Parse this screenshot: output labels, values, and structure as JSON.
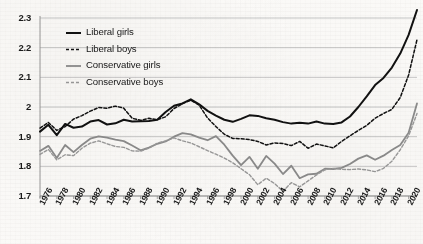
{
  "chart_data": {
    "type": "line",
    "title": "",
    "subtitle": "",
    "xlabel": "",
    "ylabel": "",
    "xlim": [
      1976,
      2021
    ],
    "ylim": [
      1.7,
      2.33
    ],
    "grid": true,
    "grid_axis": "y",
    "legend_position": "top-left",
    "y_ticks": [
      "1.7",
      "1.8",
      "1.9",
      "2",
      "2.1",
      "2.2",
      "2.3"
    ],
    "y_tick_values": [
      1.7,
      1.8,
      1.9,
      2.0,
      2.1,
      2.2,
      2.3
    ],
    "x_ticks": [
      "1976",
      "1978",
      "1980",
      "1982",
      "1984",
      "1986",
      "1988",
      "1990",
      "1992",
      "1994",
      "1996",
      "1998",
      "2000",
      "2002",
      "2004",
      "2006",
      "2008",
      "2010",
      "2012",
      "2014",
      "2016",
      "2018",
      "2020"
    ],
    "x_tick_values": [
      1976,
      1978,
      1980,
      1982,
      1984,
      1986,
      1988,
      1990,
      1992,
      1994,
      1996,
      1998,
      2000,
      2002,
      2004,
      2006,
      2008,
      2010,
      2012,
      2014,
      2016,
      2018,
      2020
    ],
    "x": [
      1976,
      1977,
      1978,
      1979,
      1980,
      1981,
      1982,
      1983,
      1984,
      1985,
      1986,
      1987,
      1988,
      1989,
      1990,
      1991,
      1992,
      1993,
      1994,
      1995,
      1996,
      1997,
      1998,
      1999,
      2000,
      2001,
      2002,
      2003,
      2004,
      2005,
      2006,
      2007,
      2008,
      2009,
      2010,
      2011,
      2012,
      2013,
      2014,
      2015,
      2016,
      2017,
      2018,
      2019,
      2020,
      2021
    ],
    "series": [
      {
        "name": "Liberal girls",
        "color": "#111111",
        "style": "solid",
        "width": 2.0,
        "values": [
          1.917,
          1.94,
          1.905,
          1.943,
          1.93,
          1.934,
          1.951,
          1.956,
          1.941,
          1.945,
          1.957,
          1.951,
          1.952,
          1.953,
          1.957,
          1.983,
          2.004,
          2.012,
          2.026,
          2.009,
          1.987,
          1.971,
          1.957,
          1.95,
          1.96,
          1.972,
          1.97,
          1.962,
          1.957,
          1.949,
          1.944,
          1.947,
          1.944,
          1.951,
          1.944,
          1.943,
          1.948,
          1.968,
          2.0,
          2.036,
          2.074,
          2.098,
          2.133,
          2.18,
          2.243,
          2.327
        ]
      },
      {
        "name": "Liberal boys",
        "color": "#111111",
        "style": "dashed",
        "width": 1.5,
        "values": [
          1.929,
          1.948,
          1.921,
          1.934,
          1.959,
          1.971,
          1.986,
          1.998,
          1.996,
          2.003,
          1.996,
          1.962,
          1.955,
          1.962,
          1.957,
          1.967,
          1.995,
          2.011,
          2.023,
          2.006,
          1.963,
          1.934,
          1.908,
          1.894,
          1.893,
          1.89,
          1.884,
          1.872,
          1.879,
          1.877,
          1.87,
          1.884,
          1.861,
          1.875,
          1.869,
          1.862,
          1.884,
          1.903,
          1.921,
          1.938,
          1.962,
          1.978,
          1.992,
          2.032,
          2.108,
          2.227
        ]
      },
      {
        "name": "Conservative girls",
        "color": "#8c8c8c",
        "style": "solid",
        "width": 1.8,
        "values": [
          1.852,
          1.869,
          1.828,
          1.872,
          1.848,
          1.872,
          1.893,
          1.901,
          1.897,
          1.89,
          1.885,
          1.87,
          1.854,
          1.863,
          1.876,
          1.884,
          1.9,
          1.912,
          1.908,
          1.897,
          1.888,
          1.902,
          1.873,
          1.836,
          1.804,
          1.832,
          1.792,
          1.835,
          1.809,
          1.774,
          1.802,
          1.76,
          1.773,
          1.775,
          1.792,
          1.791,
          1.795,
          1.808,
          1.826,
          1.837,
          1.822,
          1.836,
          1.855,
          1.872,
          1.913,
          2.012
        ]
      },
      {
        "name": "Conservative boys",
        "color": "#9a9a9a",
        "style": "dashed",
        "width": 1.4,
        "values": [
          1.84,
          1.857,
          1.822,
          1.839,
          1.836,
          1.861,
          1.878,
          1.886,
          1.876,
          1.867,
          1.864,
          1.852,
          1.851,
          1.861,
          1.878,
          1.886,
          1.896,
          1.886,
          1.879,
          1.866,
          1.853,
          1.841,
          1.828,
          1.812,
          1.792,
          1.772,
          1.738,
          1.76,
          1.742,
          1.716,
          1.745,
          1.731,
          1.751,
          1.771,
          1.788,
          1.793,
          1.79,
          1.789,
          1.791,
          1.788,
          1.782,
          1.793,
          1.817,
          1.856,
          1.903,
          1.978
        ]
      }
    ]
  },
  "legend": {
    "items": [
      {
        "label": "Liberal girls"
      },
      {
        "label": "Liberal boys"
      },
      {
        "label": "Conservative girls"
      },
      {
        "label": "Conservative boys"
      }
    ]
  }
}
